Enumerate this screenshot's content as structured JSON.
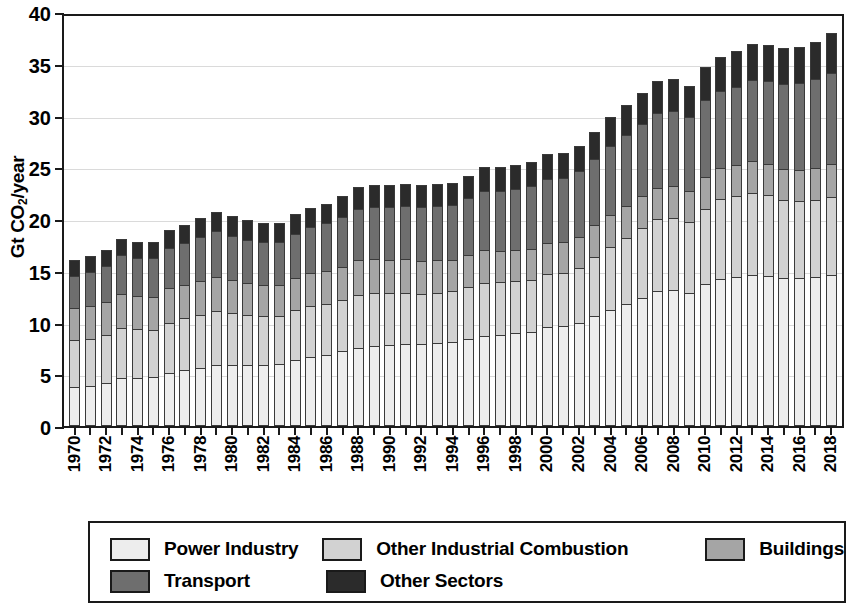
{
  "axes": {
    "ylabel_prefix": "Gt CO",
    "ylabel_sub": "2",
    "ylabel_suffix": "/year",
    "ylabel_full": "Gt CO2/year",
    "yticks": [
      0,
      5,
      10,
      15,
      20,
      25,
      30,
      35,
      40
    ]
  },
  "legend": {
    "items": [
      {
        "label": "Power Industry",
        "color": "#ededed"
      },
      {
        "label": "Other Industrial Combustion",
        "color": "#d2d2d2"
      },
      {
        "label": "Buildings",
        "color": "#a5a5a5"
      },
      {
        "label": "Transport",
        "color": "#6e6e6e"
      },
      {
        "label": "Other Sectors",
        "color": "#2b2b2b"
      }
    ]
  },
  "chart_data": {
    "type": "bar",
    "stacked": true,
    "title": "",
    "xlabel": "",
    "ylabel": "Gt CO2/year",
    "ylim": [
      0,
      40
    ],
    "ytick_step": 5,
    "grid": true,
    "legend_position": "bottom",
    "xtick_label_every": 2,
    "categories": [
      "1970",
      "1971",
      "1972",
      "1973",
      "1974",
      "1975",
      "1976",
      "1977",
      "1978",
      "1979",
      "1980",
      "1981",
      "1982",
      "1983",
      "1984",
      "1985",
      "1986",
      "1987",
      "1988",
      "1989",
      "1990",
      "1991",
      "1992",
      "1993",
      "1994",
      "1995",
      "1996",
      "1997",
      "1998",
      "1999",
      "2000",
      "2001",
      "2002",
      "2003",
      "2004",
      "2005",
      "2006",
      "2007",
      "2008",
      "2009",
      "2010",
      "2011",
      "2012",
      "2013",
      "2014",
      "2015",
      "2016",
      "2017",
      "2018"
    ],
    "series": [
      {
        "name": "Power Industry",
        "color": "#ededed",
        "values": [
          3.8,
          3.9,
          4.2,
          4.6,
          4.6,
          4.7,
          5.1,
          5.4,
          5.6,
          5.9,
          5.9,
          5.9,
          5.9,
          6.0,
          6.4,
          6.7,
          6.9,
          7.2,
          7.5,
          7.7,
          7.8,
          7.9,
          7.9,
          8.0,
          8.1,
          8.4,
          8.7,
          8.8,
          9.0,
          9.1,
          9.6,
          9.7,
          10.0,
          10.6,
          11.2,
          11.8,
          12.4,
          13.0,
          13.1,
          12.9,
          13.7,
          14.2,
          14.4,
          14.6,
          14.5,
          14.3,
          14.3,
          14.4,
          14.6
        ]
      },
      {
        "name": "Other Industrial Combustion",
        "color": "#d2d2d2",
        "values": [
          4.5,
          4.5,
          4.6,
          4.9,
          4.8,
          4.6,
          4.9,
          5.0,
          5.1,
          5.2,
          5.0,
          4.8,
          4.7,
          4.6,
          4.8,
          4.9,
          4.9,
          5.0,
          5.2,
          5.2,
          5.1,
          5.0,
          4.9,
          4.9,
          4.9,
          5.0,
          5.1,
          5.1,
          5.0,
          5.0,
          5.1,
          5.1,
          5.3,
          5.7,
          6.1,
          6.4,
          6.7,
          7.0,
          7.0,
          6.8,
          7.3,
          7.7,
          7.8,
          7.9,
          7.8,
          7.5,
          7.4,
          7.4,
          7.5
        ]
      },
      {
        "name": "Buildings",
        "color": "#a5a5a5",
        "values": [
          3.1,
          3.2,
          3.2,
          3.3,
          3.2,
          3.2,
          3.3,
          3.2,
          3.3,
          3.3,
          3.2,
          3.1,
          3.0,
          3.0,
          3.1,
          3.2,
          3.2,
          3.2,
          3.3,
          3.2,
          3.1,
          3.2,
          3.1,
          3.1,
          3.0,
          3.1,
          3.2,
          3.0,
          3.0,
          3.0,
          3.0,
          3.0,
          3.0,
          3.1,
          3.1,
          3.1,
          3.1,
          3.0,
          3.1,
          3.0,
          3.1,
          3.0,
          3.0,
          3.1,
          3.0,
          3.0,
          3.0,
          3.1,
          3.2
        ]
      },
      {
        "name": "Transport",
        "color": "#6e6e6e",
        "values": [
          3.1,
          3.3,
          3.5,
          3.7,
          3.6,
          3.7,
          3.9,
          4.1,
          4.3,
          4.4,
          4.3,
          4.2,
          4.2,
          4.2,
          4.3,
          4.4,
          4.6,
          4.8,
          5.0,
          5.1,
          5.2,
          5.2,
          5.3,
          5.3,
          5.4,
          5.5,
          5.7,
          5.8,
          5.9,
          6.1,
          6.2,
          6.2,
          6.3,
          6.4,
          6.7,
          6.8,
          7.0,
          7.2,
          7.2,
          7.2,
          7.4,
          7.5,
          7.6,
          7.8,
          8.0,
          8.2,
          8.4,
          8.6,
          8.8
        ]
      },
      {
        "name": "Other Sectors",
        "color": "#2b2b2b",
        "values": [
          1.5,
          1.5,
          1.5,
          1.6,
          1.6,
          1.6,
          1.7,
          1.7,
          1.8,
          1.9,
          1.9,
          1.9,
          1.8,
          1.8,
          1.9,
          1.9,
          1.9,
          2.0,
          2.1,
          2.1,
          2.1,
          2.1,
          2.1,
          2.1,
          2.1,
          2.2,
          2.3,
          2.3,
          2.3,
          2.3,
          2.4,
          2.4,
          2.5,
          2.6,
          2.8,
          2.9,
          3.0,
          3.1,
          3.1,
          3.0,
          3.2,
          3.3,
          3.4,
          3.5,
          3.5,
          3.5,
          3.5,
          3.6,
          3.9
        ]
      }
    ]
  }
}
